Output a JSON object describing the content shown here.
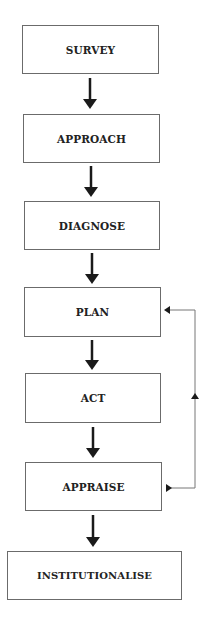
{
  "diagram": {
    "type": "flowchart",
    "steps": [
      {
        "id": "survey",
        "label": "SURVEY"
      },
      {
        "id": "approach",
        "label": "APPROACH"
      },
      {
        "id": "diagnose",
        "label": "DIAGNOSE"
      },
      {
        "id": "plan",
        "label": "PLAN"
      },
      {
        "id": "act",
        "label": "ACT"
      },
      {
        "id": "appraise",
        "label": "APPRAISE"
      },
      {
        "id": "institutionalise",
        "label": "INSTITUTIONALISE"
      }
    ],
    "edges": [
      {
        "from": "survey",
        "to": "approach"
      },
      {
        "from": "approach",
        "to": "diagnose"
      },
      {
        "from": "diagnose",
        "to": "plan"
      },
      {
        "from": "plan",
        "to": "act"
      },
      {
        "from": "act",
        "to": "appraise"
      },
      {
        "from": "appraise",
        "to": "institutionalise"
      },
      {
        "from": "appraise",
        "to": "plan",
        "kind": "feedback-loop"
      }
    ],
    "colors": {
      "box_border": "#6b6b6b",
      "text": "#222222",
      "arrow": "#1a1a1a",
      "feedback_line": "#777777"
    }
  }
}
